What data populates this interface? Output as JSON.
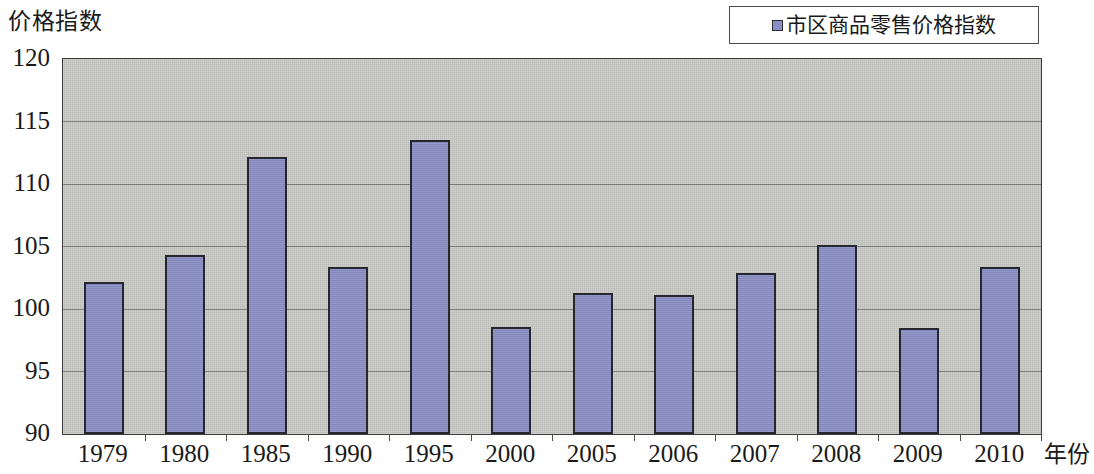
{
  "chart_data": {
    "type": "bar",
    "title": "",
    "ylabel": "价格指数",
    "xlabel": "年份",
    "categories": [
      "1979",
      "1980",
      "1985",
      "1990",
      "1995",
      "2000",
      "2005",
      "2006",
      "2007",
      "2008",
      "2009",
      "2010"
    ],
    "series": [
      {
        "name": "市区商品零售价格指数",
        "values": [
          102.2,
          104.3,
          112.2,
          103.4,
          113.5,
          98.6,
          101.3,
          101.1,
          102.9,
          105.1,
          98.5,
          103.4
        ],
        "color": "#8b8ec4"
      }
    ],
    "ylim": [
      90,
      120
    ],
    "yticks": [
      "120",
      "115",
      "110",
      "105",
      "100",
      "95",
      "90"
    ],
    "ytick_values": [
      120,
      115,
      110,
      105,
      100,
      95,
      90
    ],
    "grid": true,
    "legend_position": "top-right",
    "plot_background": "#c9c9c6",
    "axis_color": "#3d3d3d"
  },
  "legend": {
    "entries": [
      {
        "label": "市区商品零售价格指数",
        "color": "#8b8ec4"
      }
    ]
  }
}
